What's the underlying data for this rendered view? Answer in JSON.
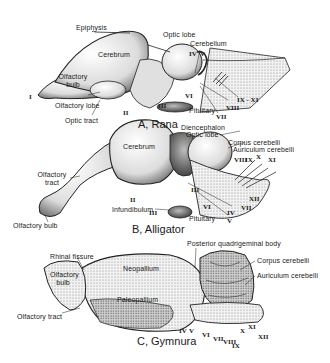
{
  "figure": {
    "panels": [
      {
        "caption": "A, Rana",
        "labels": {
          "epiphysis": "Epiphysis",
          "cerebrum": "Cerebrum",
          "optic_lobe": "Optic lobe",
          "cerebellum": "Cerebellum",
          "olfactory_bulb": "Olfactory bulb",
          "olfactory_lobe": "Olfactory lobe",
          "optic_tract": "Optic tract",
          "pituitary": "Pituitary"
        },
        "nerves": [
          "I",
          "II",
          "III",
          "IV",
          "V",
          "VI",
          "VII",
          "VIII",
          "IX - XI"
        ]
      },
      {
        "caption": "B, Alligator",
        "labels": {
          "diencephalon": "Diencephalon",
          "optic_lobe": "Optic lobe",
          "cerebrum": "Cerebrum",
          "corpus_cerebelli": "Corpus cerebelli",
          "auriculum_cerebelli": "Auriculum cerebelli",
          "olfactory_tract": "Olfactory tract",
          "olfactory_bulb": "Olfactory bulb",
          "infundibulum": "Infundibulum",
          "pituitary": "Pituitary"
        },
        "nerves": [
          "II",
          "III",
          "IV",
          "V",
          "VI",
          "VII",
          "VIII",
          "IX",
          "X",
          "XI",
          "XII",
          "III"
        ]
      },
      {
        "caption": "C, Gymnura",
        "labels": {
          "posterior_quadrigeminal_body": "Posterior quadrigeminal body",
          "rhinal_fissure": "Rhinal fissure",
          "neopallium": "Neopallium",
          "olfactory_bulb": "Olfactory bulb",
          "paleopallium": "Paleopallium",
          "olfactory_tract": "Olfactory tract",
          "corpus_cerebelli": "Corpus cerebelli",
          "auriculum_cerebelli": "Auriculum cerebelli"
        },
        "nerves": [
          "IV",
          "V",
          "VI",
          "VII",
          "VIII",
          "IX",
          "X",
          "XI",
          "XII"
        ]
      }
    ]
  },
  "colors": {
    "ink": "#1a1a1a",
    "stipple": "#555555",
    "fill_light": "#e8e8e8",
    "fill_mid": "#bdbdbd",
    "fill_dark": "#6e6e6e",
    "background": "#ffffff"
  }
}
